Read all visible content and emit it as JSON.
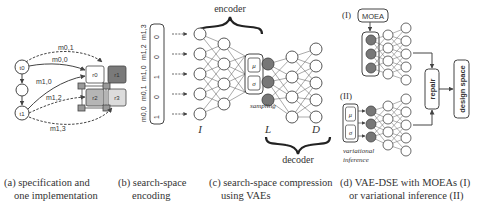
{
  "panel_a": {
    "tasks": [
      "t0",
      "t1"
    ],
    "resources": [
      "r0",
      "r1",
      "r2",
      "r3"
    ],
    "mappings": [
      "m0,1",
      "m0,0",
      "m1,0",
      "m1,2",
      "m1,3"
    ],
    "caption_line1": "(a) specification and",
    "caption_line2": "one implementation"
  },
  "panel_b": {
    "vector_labels": [
      "m0,0",
      "m0,1",
      "m1,0",
      "m1,2",
      "m1,3"
    ],
    "vector_values": [
      "1",
      "0",
      "1",
      "0",
      "0"
    ],
    "caption_line1": "(b) search-space",
    "caption_line2": "encoding"
  },
  "panel_c": {
    "encoder_label": "encoder",
    "decoder_label": "decoder",
    "mu_label": "μ",
    "sigma_label": "σ",
    "sampling_label": "sampling",
    "layer_I": "I",
    "layer_L": "L",
    "layer_D": "D",
    "caption_line1": "(c) search-space compression",
    "caption_line2": "using VAEs"
  },
  "panel_d": {
    "label_I": "(I)",
    "label_II": "(II)",
    "moea_label": "MOEA",
    "mu_label": "μ",
    "sigma_label": "σ",
    "variational_line1": "variational",
    "variational_line2": "inference",
    "repair_label": "repair",
    "design_space_label": "design space",
    "caption_line1": "(d) VAE-DSE with MOEAs (I)",
    "caption_line2": "or variational inference (II)"
  },
  "colors": {
    "stroke": "#444444",
    "latent_fill": "#777777",
    "r1_fill": "#7a7a7a",
    "r2_fill": "#b5b5b5",
    "r3_fill": "#dcdcdc",
    "connector_fill": "#9a9a9a"
  }
}
